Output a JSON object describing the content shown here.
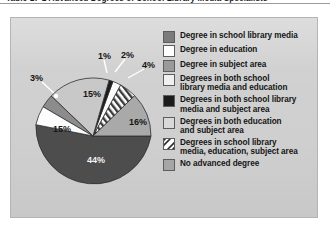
{
  "caption": {
    "text": "Table 17-1   Advanced Degrees of School Library Media Specialists"
  },
  "chart_data": {
    "type": "pie",
    "title": "Advanced Degrees of School Library Media Specialists",
    "legend_position": "right",
    "categories": [
      "Degree in school library media",
      "Degree in education",
      "Degree in subject area",
      "Degrees in both school library media and education",
      "Degrees in both school library media and subject area",
      "Degrees in both education and subject area",
      "Degrees in school library media, education, subject area",
      "No advanced degree"
    ],
    "values": [
      15,
      15,
      3,
      1,
      2,
      4,
      16,
      44
    ],
    "labels": [
      "15%",
      "15%",
      "3%",
      "1%",
      "2%",
      "4%",
      "16%",
      "44%"
    ],
    "colors": [
      "#b9b9b9",
      "#ffffff",
      "#8f8f8f",
      "#eeeeee",
      "#1b1b1b",
      "#f2f2f2",
      "#ffffff",
      "#a8a8a8"
    ],
    "slices": [
      {
        "label": "15%",
        "value": 15,
        "legend_index": 0,
        "swatch": "#8a8a8a",
        "fill": "#c6c6c6",
        "pattern": "solid"
      },
      {
        "label": "1%",
        "value": 1,
        "legend_index": 1,
        "swatch": "#ffffff",
        "fill": "#ffffff",
        "pattern": "solid"
      },
      {
        "label": "2%",
        "value": 2,
        "legend_index": 2,
        "swatch": "#8f8f8f",
        "fill": "#ffffff",
        "pattern": "solid"
      },
      {
        "label": "4%",
        "value": 4,
        "legend_index": 3,
        "swatch": "#f4f4f4",
        "fill": "#f4f4f4",
        "pattern": "solid"
      },
      {
        "label": "16%",
        "value": 16,
        "legend_index": 4,
        "swatch": "#1b1b1b",
        "fill": "#a5a5a5",
        "pattern": "solid"
      },
      {
        "label": "44%",
        "value": 44,
        "legend_index": 5,
        "swatch": "#d4d4d4",
        "fill": "#4a4a4a",
        "pattern": "solid"
      },
      {
        "label": "3%",
        "value": 3,
        "legend_index": 6,
        "swatch": "stripes",
        "fill": "stripes",
        "pattern": "diagonal-stripes"
      },
      {
        "label": "15%",
        "value": 15,
        "legend_index": 7,
        "swatch": "#9d9d9d",
        "fill": "#ffffff",
        "pattern": "solid"
      }
    ],
    "percent_labels": [
      {
        "name": "pct-1",
        "text": "1%",
        "x": 87,
        "y": 34
      },
      {
        "name": "pct-2",
        "text": "2%",
        "x": 110,
        "y": 33
      },
      {
        "name": "pct-4",
        "text": "4%",
        "x": 131,
        "y": 43
      },
      {
        "name": "pct-3",
        "text": "3%",
        "x": 19,
        "y": 56
      },
      {
        "name": "pct-15a",
        "text": "15%",
        "x": 72,
        "y": 72
      },
      {
        "name": "pct-16",
        "text": "16%",
        "x": 118,
        "y": 100
      },
      {
        "name": "pct-15b",
        "text": "15%",
        "x": 42,
        "y": 107
      },
      {
        "name": "pct-44",
        "text": "44%",
        "x": 76,
        "y": 138
      }
    ]
  },
  "legend": {
    "items": [
      {
        "label": "Degree in school library media",
        "swatch": "#7b7b7b",
        "pattern": "solid"
      },
      {
        "label": "Degree in education",
        "swatch": "#ffffff",
        "pattern": "solid"
      },
      {
        "label": "Degree in subject area",
        "swatch": "#9a9a9a",
        "pattern": "solid"
      },
      {
        "label": "Degrees in both school\nlibrary media and education",
        "swatch": "#f0f0f0",
        "pattern": "solid"
      },
      {
        "label": "Degrees in both school library\nmedia and subject area",
        "swatch": "#1c1c1c",
        "pattern": "solid"
      },
      {
        "label": "Degrees in both education\nand subject area",
        "swatch": "#d9d9d9",
        "pattern": "solid"
      },
      {
        "label": "Degrees in school library\nmedia, education, subject area",
        "swatch": "stripes",
        "pattern": "diagonal-stripes"
      },
      {
        "label": "No advanced degree",
        "swatch": "#a6a6a6",
        "pattern": "solid"
      }
    ]
  }
}
